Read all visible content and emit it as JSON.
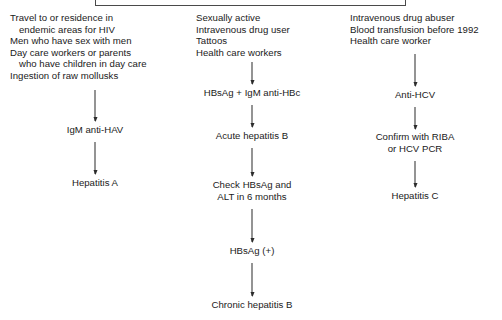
{
  "diagram": {
    "title_box": {
      "name": "top-title-box",
      "visible_text": ""
    },
    "columns": [
      {
        "id": "hepatitis-a",
        "name": "hepatitis-a-column",
        "risk_factors": [
          "Travel to or residence in",
          "endemic areas for HIV",
          "Men who have sex with men",
          "Day care workers or parents",
          "who have children in day care",
          "Ingestion of raw mollusks"
        ],
        "steps": [
          {
            "label": "IgM anti-HAV"
          },
          {
            "label": "Hepatitis A"
          }
        ]
      },
      {
        "id": "hepatitis-b",
        "name": "hepatitis-b-column",
        "risk_factors": [
          "Sexually active",
          "Intravenous drug user",
          "Tattoos",
          "Health care workers"
        ],
        "steps": [
          {
            "label": "HBsAg + IgM anti-HBc"
          },
          {
            "label": "Acute hepatitis B"
          },
          {
            "label_line1": "Check HBsAg and",
            "label_line2": "ALT in 6 months"
          },
          {
            "label": "HBsAg (+)"
          },
          {
            "label": "Chronic hepatitis B"
          }
        ]
      },
      {
        "id": "hepatitis-c",
        "name": "hepatitis-c-column",
        "risk_factors": [
          "Intravenous drug abuser",
          "Blood transfusion before 1992",
          "Health care worker"
        ],
        "steps": [
          {
            "label": "Anti-HCV"
          },
          {
            "label_line1": "Confirm with RIBA",
            "label_line2": "or HCV PCR"
          },
          {
            "label": "Hepatitis C"
          }
        ]
      }
    ],
    "colors": {
      "text": "#1a1a1a",
      "arrow": "#2b2b2b",
      "box_border": "#4a4a4a",
      "background": "#ffffff"
    }
  }
}
